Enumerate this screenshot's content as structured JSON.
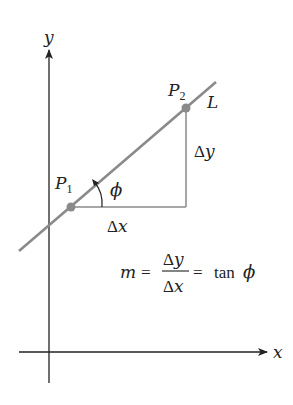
{
  "diagram": {
    "axes": {
      "x_label": "x",
      "y_label": "y"
    },
    "line": {
      "label": "L",
      "color": "#8a8a8a"
    },
    "points": [
      {
        "label_main": "P",
        "label_sub": "1",
        "color": "#8a8a8a"
      },
      {
        "label_main": "P",
        "label_sub": "2",
        "color": "#8a8a8a"
      }
    ],
    "triangle": {
      "run_label": "Δx",
      "rise_label": "Δy",
      "color": "#8a8a8a"
    },
    "angle": {
      "label": "ϕ"
    },
    "formula": {
      "lhs": "m",
      "eq1": "=",
      "numerator": "Δy",
      "denominator": "Δx",
      "eq2": "=",
      "rhs_fn": "tan",
      "rhs_arg": "ϕ"
    },
    "colors": {
      "axis": "#222222",
      "line": "#8a8a8a",
      "text": "#222222"
    }
  }
}
